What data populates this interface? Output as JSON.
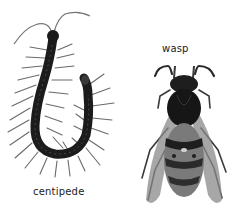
{
  "image": {
    "description": "Grayscale photos of two arthropods on white background with lowercase captions",
    "background_color": "#ffffff"
  },
  "subjects": [
    {
      "name": "centipede",
      "label": "centipede",
      "position": "left",
      "pose": "curled U-shape, head at top-left, tail hooking up on the right",
      "color": "#1c1c1c"
    },
    {
      "name": "wasp",
      "label": "wasp",
      "position": "right",
      "pose": "dorsal view, head at top, antennae curled outward, wings folded along abdomen",
      "color": "#222222"
    }
  ]
}
